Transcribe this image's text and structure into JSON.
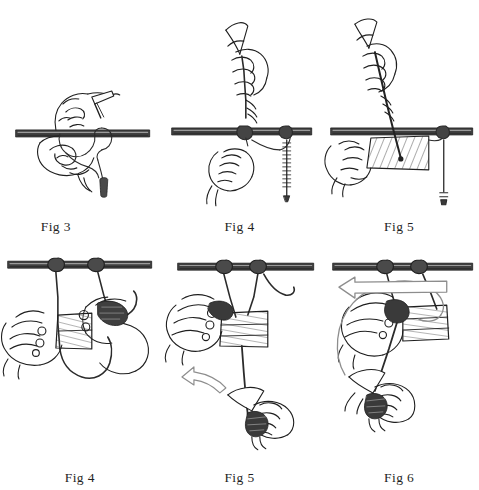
{
  "document": {
    "kind": "instructional-line-art-plate",
    "subject": "rope knot tying with marlinspike, pole and wooden plank",
    "background_color": "#ffffff",
    "ink_color": "#1f1f1f",
    "grid": {
      "columns": 3,
      "rows": 2
    }
  },
  "figures": [
    {
      "id": "fig-3-top-left",
      "caption": "Fig 3",
      "caption_align": "left-of-center",
      "elements": [
        "horizontal-pole",
        "left-hand-holding-rope",
        "right-hand-with-marlinspike",
        "rope-loop-around-pole",
        "hanging-rope-tail",
        "whipped-rope-end"
      ]
    },
    {
      "id": "fig-4-top-center",
      "caption": "Fig 4",
      "caption_align": "center",
      "elements": [
        "horizontal-pole",
        "upper-hand-gripping-marlinspike",
        "lower-hand-pulling-rope",
        "knot-on-pole",
        "whipped-rope-end",
        "vertical-standing-part"
      ]
    },
    {
      "id": "fig-5-top-right",
      "caption": "Fig 5",
      "caption_align": "center",
      "elements": [
        "horizontal-pole",
        "upper-hand-gripping-marlinspike",
        "lower-hand-holding-plank",
        "hatched-wooden-plank",
        "knot-on-pole",
        "vertical-standing-part",
        "whipped-rope-end"
      ]
    },
    {
      "id": "fig-4-bottom-left",
      "caption": "Fig 4",
      "caption_align": "center",
      "elements": [
        "horizontal-pole",
        "two-knots-on-pole",
        "two-rope-legs",
        "left-hand-supporting-plank",
        "right-hand-tying",
        "hatched-wooden-plank",
        "rope-bight-below-plank"
      ]
    },
    {
      "id": "fig-5-bottom-center",
      "caption": "Fig 5",
      "caption_align": "center",
      "elements": [
        "horizontal-pole",
        "two-knots-on-pole",
        "two-rope-legs",
        "left-hand-holding-plank",
        "hatched-wooden-plank",
        "vertical-rope-below-plank",
        "lower-hand-with-marlinspike",
        "curved-arrow-up-left"
      ]
    },
    {
      "id": "fig-6-bottom-right",
      "caption": "Fig 6",
      "caption_align": "center",
      "elements": [
        "horizontal-pole",
        "two-knots-on-pole",
        "two-rope-legs",
        "hatched-wooden-plank",
        "upper-hand-gripping-rope",
        "lower-hand-with-marlinspike",
        "large-circular-arrow-counterclockwise",
        "diagonal-rope"
      ]
    }
  ],
  "captions": {
    "top_row": [
      "Fig 3",
      "Fig 4",
      "Fig 5"
    ],
    "bottom_row": [
      "Fig 4",
      "Fig 5",
      "Fig 6"
    ]
  },
  "style": {
    "pole_fill": "#3a3a3a",
    "pole_highlight": "#8e8e8e",
    "hatch_color": "#5a5a5a",
    "rope_color": "#2b2b2b",
    "outline_color": "#1f1f1f",
    "arrow_outline": "#8a8a8a"
  }
}
